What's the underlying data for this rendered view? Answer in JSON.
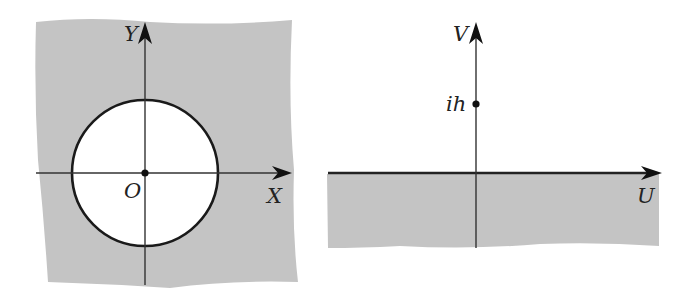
{
  "colors": {
    "region_fill": "#c4c4c4",
    "line": "#1a1a1a",
    "background": "#ffffff",
    "disk_fill": "#ffffff"
  },
  "left_panel": {
    "name": "z-plane",
    "region": "exterior of unit circle (shaded)",
    "x_axis_label": "X",
    "y_axis_label": "Y",
    "origin_label": "O",
    "circle": {
      "center": [
        145,
        173
      ],
      "radius": 73
    }
  },
  "right_panel": {
    "name": "w-plane",
    "region": "lower half-plane (shaded)",
    "u_axis_label": "U",
    "v_axis_label": "V",
    "point_label": "ih"
  }
}
